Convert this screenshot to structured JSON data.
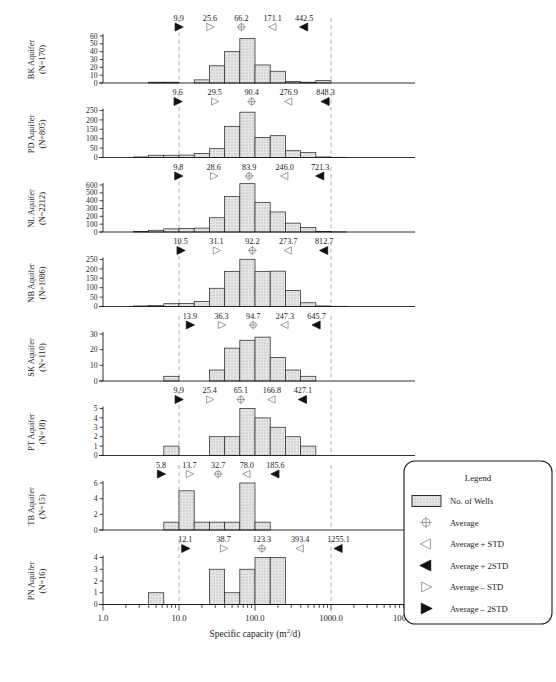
{
  "figure": {
    "xtitle": "Specific capacity (m²/d)",
    "xticks": [
      "1.0",
      "10.0",
      "100.0",
      "1000.0",
      "10000.0"
    ],
    "xlim_log": [
      0,
      4
    ],
    "guide_lines": [
      1,
      3
    ],
    "marker_order": [
      "avg_minus_2std",
      "avg_minus_std",
      "average",
      "avg_plus_std",
      "avg_plus_2std"
    ]
  },
  "legend": {
    "title": "Legend",
    "items": [
      {
        "icon": "hatched-swatch",
        "label": "No. of Wells"
      },
      {
        "icon": "circle-plus-icon",
        "label": "Average"
      },
      {
        "icon": "triangle-left-open-icon",
        "label": "Average + STD"
      },
      {
        "icon": "triangle-left-filled-icon",
        "label": "Average + 2STD"
      },
      {
        "icon": "triangle-right-open-icon",
        "label": "Average – STD"
      },
      {
        "icon": "triangle-right-filled-icon",
        "label": "Average – 2STD"
      }
    ]
  },
  "chart_data": {
    "type": "bar",
    "title": "",
    "xlabel": "Specific capacity (m²/d)",
    "ylabel": "No. of Wells",
    "xscale": "log",
    "xlim": [
      1.0,
      10000.0
    ],
    "bin_edges_log": [
      0.0,
      0.2,
      0.4,
      0.6,
      0.8,
      1.0,
      1.2,
      1.4,
      1.6,
      1.8,
      2.0,
      2.2,
      2.4,
      2.6,
      2.8,
      3.0,
      3.2,
      3.4,
      3.6,
      3.8,
      4.0
    ],
    "panels": [
      {
        "name": "BK Aquifer",
        "n_label": "(N=170)",
        "n": 170,
        "ylim": [
          0,
          60
        ],
        "yticks": [
          0,
          10,
          20,
          30,
          40,
          50,
          60
        ],
        "values": [
          0,
          0,
          0,
          1,
          1,
          0,
          4,
          22,
          40,
          57,
          23,
          15,
          2,
          1,
          3,
          0,
          0,
          0,
          0,
          0
        ],
        "stats": {
          "avg_minus_2std": "9.9",
          "avg_minus_std": "25.6",
          "average": "66.2",
          "avg_plus_std": "171.1",
          "avg_plus_2std": "442.5"
        }
      },
      {
        "name": "PD Aquifer",
        "n_label": "(N=805)",
        "n": 805,
        "ylim": [
          0,
          250
        ],
        "yticks": [
          0,
          50,
          100,
          150,
          200,
          250
        ],
        "values": [
          0,
          0,
          3,
          12,
          12,
          13,
          21,
          47,
          166,
          241,
          107,
          116,
          36,
          27,
          3,
          1,
          0,
          0,
          0,
          0
        ],
        "stats": {
          "avg_minus_2std": "9.6",
          "avg_minus_std": "29.5",
          "average": "90.4",
          "avg_plus_std": "276.9",
          "avg_plus_2std": "848.3"
        }
      },
      {
        "name": "NL Aquifer",
        "n_label": "(N=2212)",
        "n": 2212,
        "ylim": [
          0,
          600
        ],
        "yticks": [
          0,
          100,
          200,
          300,
          400,
          500,
          600
        ],
        "values": [
          0,
          0,
          5,
          22,
          40,
          43,
          50,
          182,
          452,
          617,
          377,
          256,
          113,
          58,
          5,
          2,
          0,
          0,
          0,
          0
        ],
        "stats": {
          "avg_minus_2std": "9.8",
          "avg_minus_std": "28.6",
          "average": "83.9",
          "avg_plus_std": "246.0",
          "avg_plus_2std": "721.3"
        }
      },
      {
        "name": "NB Aquifer",
        "n_label": "(N=1086)",
        "n": 1086,
        "ylim": [
          0,
          250
        ],
        "yticks": [
          0,
          50,
          100,
          150,
          200,
          250
        ],
        "values": [
          0,
          0,
          3,
          5,
          15,
          16,
          27,
          97,
          187,
          251,
          187,
          188,
          85,
          20,
          3,
          1,
          0,
          0,
          0,
          0
        ],
        "stats": {
          "avg_minus_2std": "10.5",
          "avg_minus_std": "31.1",
          "average": "92.2",
          "avg_plus_std": "273.7",
          "avg_plus_2std": "812.7"
        }
      },
      {
        "name": "SK Aquifer",
        "n_label": "(N=110)",
        "n": 110,
        "ylim": [
          0,
          30
        ],
        "yticks": [
          0,
          10,
          20,
          30
        ],
        "values": [
          0,
          0,
          0,
          0,
          3,
          0,
          0,
          7,
          21,
          26,
          28,
          15,
          7,
          3,
          0,
          0,
          0,
          0,
          0,
          0
        ],
        "stats": {
          "avg_minus_2std": "13.9",
          "avg_minus_std": "36.3",
          "average": "94.7",
          "avg_plus_std": "247.3",
          "avg_plus_2std": "645.7"
        }
      },
      {
        "name": "PT Aquifer",
        "n_label": "(N=18)",
        "n": 18,
        "ylim": [
          0,
          5
        ],
        "yticks": [
          0,
          1,
          2,
          3,
          4,
          5
        ],
        "values": [
          0,
          0,
          0,
          0,
          1,
          0,
          0,
          2,
          2,
          5,
          4,
          3,
          2,
          1,
          0,
          0,
          0,
          0,
          0,
          0
        ],
        "stats": {
          "avg_minus_2std": "9.9",
          "avg_minus_std": "25.4",
          "average": "65.1",
          "avg_plus_std": "166.8",
          "avg_plus_2std": "427.1"
        }
      },
      {
        "name": "TB Aquifer",
        "n_label": "(N=15)",
        "n": 15,
        "ylim": [
          0,
          6
        ],
        "yticks": [
          0,
          2,
          4,
          6
        ],
        "values": [
          0,
          0,
          0,
          0,
          1,
          5,
          1,
          1,
          1,
          6,
          1,
          0,
          0,
          0,
          0,
          0,
          0,
          0,
          0,
          0
        ],
        "stats": {
          "avg_minus_2std": "5.8",
          "avg_minus_std": "13.7",
          "average": "32.7",
          "avg_plus_std": "78.0",
          "avg_plus_2std": "185.6"
        }
      },
      {
        "name": "PN Aquifer",
        "n_label": "(N=16)",
        "n": 16,
        "ylim": [
          0,
          4
        ],
        "yticks": [
          0,
          1,
          2,
          3,
          4
        ],
        "values": [
          0,
          0,
          0,
          1,
          0,
          0,
          0,
          3,
          1,
          3,
          4,
          4,
          0,
          0,
          0,
          0,
          0,
          0,
          0,
          0
        ],
        "stats": {
          "avg_minus_2std": "12.1",
          "avg_minus_std": "38.7",
          "average": "123.3",
          "avg_plus_std": "393.4",
          "avg_plus_2std": "1255.1"
        }
      }
    ]
  }
}
